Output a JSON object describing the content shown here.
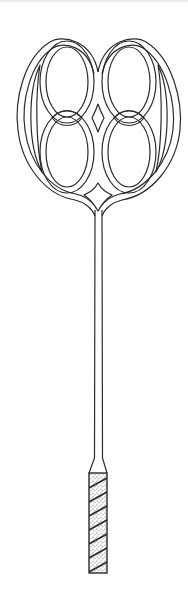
{
  "illustration": {
    "subject": "Carpet beater",
    "parts": [
      "head",
      "stem",
      "handle"
    ],
    "colors": {
      "line": "#2b2b2b",
      "background": "#ffffff",
      "handle_fill": "#d9d9d9"
    }
  }
}
